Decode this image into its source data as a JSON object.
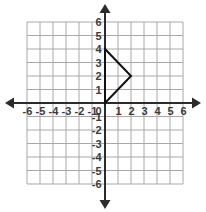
{
  "chart_data": {
    "type": "scatter",
    "title": "",
    "xlabel": "",
    "ylabel": "",
    "xlim": [
      -6,
      6
    ],
    "ylim": [
      -6,
      6
    ],
    "grid": true,
    "legend": null,
    "x_tick_labels": [
      "-6",
      "-5",
      "-4",
      "-3",
      "-2",
      "-1",
      "1",
      "2",
      "3",
      "4",
      "5",
      "6"
    ],
    "y_tick_labels": [
      "-6",
      "-5",
      "-4",
      "-3",
      "-2",
      "-1",
      "1",
      "2",
      "3",
      "4",
      "5",
      "6"
    ],
    "origin_label": "0",
    "x_ticks": [
      -6,
      -5,
      -4,
      -3,
      -2,
      -1,
      1,
      2,
      3,
      4,
      5,
      6
    ],
    "y_ticks": [
      -6,
      -5,
      -4,
      -3,
      -2,
      -1,
      1,
      2,
      3,
      4,
      5,
      6
    ],
    "grid_step": 1,
    "series": [
      {
        "name": "triangle",
        "shape": "triangle",
        "closed": true,
        "points": [
          [
            0,
            4
          ],
          [
            2,
            2
          ],
          [
            0,
            0
          ]
        ],
        "color": "#111111"
      }
    ],
    "colors": {
      "grid": "#a8a8a8",
      "axis": "#2b2b2b",
      "shape": "#111111",
      "label": "#3a3a3a",
      "background": "#ffffff"
    }
  },
  "figure": {
    "caption": ""
  }
}
